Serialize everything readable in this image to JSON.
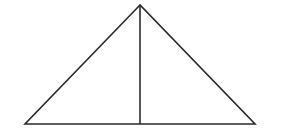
{
  "diagram": {
    "type": "triangle-with-altitude",
    "stroke_color": "#2a2a2a",
    "background_color": "#ffffff",
    "stroke_width": 1.6,
    "vertices": {
      "apex": {
        "x": 140,
        "y": 5
      },
      "bottom_left": {
        "x": 25,
        "y": 124
      },
      "bottom_right": {
        "x": 255,
        "y": 124
      }
    },
    "altitude": {
      "x1": 140,
      "y1": 5,
      "x2": 140,
      "y2": 124
    }
  }
}
